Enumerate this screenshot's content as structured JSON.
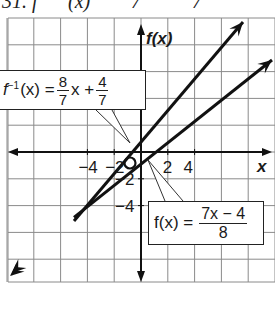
{
  "header_fragment": {
    "left": "31. f",
    "mid": "(x)",
    "right_a": "7",
    "right_b": "7"
  },
  "chart_data": {
    "type": "line",
    "title": "",
    "xlabel": "x",
    "ylabel": "f(x)",
    "xlim": [
      -5,
      5
    ],
    "ylim": [
      -5,
      5
    ],
    "grid": true,
    "grid_step": 1,
    "x_ticks": [
      -4,
      -2,
      2,
      4
    ],
    "y_ticks": [
      4,
      -2,
      -4
    ],
    "x_tick_labels": [
      "−4",
      "−2",
      "2",
      "4"
    ],
    "y_tick_labels": [
      "4",
      "−2",
      "−4"
    ],
    "series": [
      {
        "name": "f^-1(x) = 8/7 x + 4/7",
        "slope": 1.142857,
        "intercept": 0.571429,
        "x": [
          -5,
          3.8
        ],
        "y": [
          -5.143,
          4.914
        ]
      },
      {
        "name": "f(x) = (7x - 4)/8",
        "slope": 0.875,
        "intercept": -0.5,
        "x": [
          -5,
          5
        ],
        "y": [
          -4.875,
          3.875
        ]
      }
    ],
    "annotations": [
      {
        "text": "f⁻¹(x) = 8/7 x + 4/7",
        "target": "upper line"
      },
      {
        "text": "f(x) = (7x − 4)/8",
        "target": "lower line"
      },
      {
        "text": "O",
        "position": "origin"
      }
    ]
  },
  "labels": {
    "x_axis": "x",
    "y_axis": "f(x)",
    "origin": "O",
    "tick_x_neg4": "−4",
    "tick_x_neg2": "−2",
    "tick_x_2": "2",
    "tick_x_4": "4",
    "tick_y_4": "4",
    "tick_y_neg2": "−2",
    "tick_y_neg4": "−4"
  },
  "callouts": {
    "inverse": {
      "fn": "f",
      "sup": "−1",
      "arg": "(x) =",
      "frac1_num": "8",
      "frac1_den": "7",
      "var": "x +",
      "frac2_num": "4",
      "frac2_den": "7"
    },
    "original": {
      "lhs": "f(x) =",
      "num": "7x − 4",
      "den": "8"
    }
  }
}
